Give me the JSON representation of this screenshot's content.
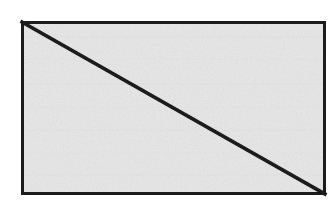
{
  "figure": {
    "shape_kind": "rectangle-with-diagonal",
    "background_color": "#ffffff",
    "fill_color": "#ececec",
    "stroke_color": "#1a1a1a",
    "border_thickness_px": 3,
    "diagonal_thickness_px": 3.5,
    "rect": {
      "x": 21,
      "y": 21,
      "width": 305,
      "height": 174
    },
    "diagonal": {
      "from_corner": "top-left",
      "to_corner": "bottom-right",
      "x1": 22,
      "y1": 22,
      "x2": 325,
      "y2": 194
    },
    "labels": [],
    "annotations": []
  },
  "canvas": {
    "width": 336,
    "height": 211
  }
}
